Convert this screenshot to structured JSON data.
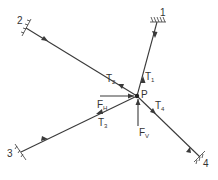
{
  "diagram": {
    "type": "force-diagram",
    "point": {
      "label": "P",
      "x": 137,
      "y": 96
    },
    "supports": [
      {
        "label": "1",
        "x": 157,
        "y": 22
      },
      {
        "label": "2",
        "x": 26,
        "y": 28
      },
      {
        "label": "3",
        "x": 21,
        "y": 152
      },
      {
        "label": "4",
        "x": 200,
        "y": 157
      }
    ],
    "tensions": [
      {
        "label": "T",
        "sub": "1"
      },
      {
        "label": "T",
        "sub": "2"
      },
      {
        "label": "T",
        "sub": "3"
      },
      {
        "label": "T",
        "sub": "4"
      }
    ],
    "forces": [
      {
        "label": "F",
        "sub": "H"
      },
      {
        "label": "F",
        "sub": "V"
      }
    ],
    "caption": ""
  }
}
